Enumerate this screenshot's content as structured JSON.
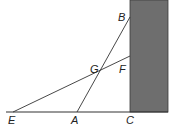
{
  "diagram": {
    "type": "geometry",
    "colors": {
      "wall_fill": "#6e6e6e",
      "wall_stroke": "#3a3a3a",
      "line": "#333333",
      "label": "#222222",
      "background": "#ffffff"
    },
    "points": {
      "B": {
        "label": "B",
        "x": 130,
        "y": 17
      },
      "F": {
        "label": "F",
        "x": 130,
        "y": 56
      },
      "G": {
        "label": "G",
        "x": 100,
        "y": 69
      },
      "E": {
        "label": "E",
        "x": 13,
        "y": 112
      },
      "A": {
        "label": "A",
        "x": 77,
        "y": 112
      },
      "C": {
        "label": "C",
        "x": 130,
        "y": 112
      }
    },
    "segments": [
      {
        "from": "A",
        "to": "B"
      },
      {
        "from": "E",
        "to": "F"
      },
      {
        "from": "E",
        "to": "C"
      }
    ],
    "labels": {
      "B": "B",
      "G": "G",
      "F": "F",
      "E": "E",
      "A": "A",
      "C": "C"
    }
  }
}
